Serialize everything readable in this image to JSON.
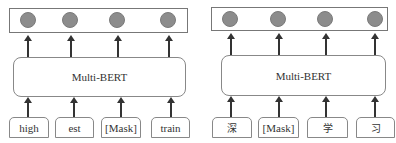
{
  "left_panel": {
    "encoder_label": "Multi-BERT",
    "tokens": [
      "high",
      "est",
      "[Mask]",
      "train"
    ],
    "output_nodes": 4
  },
  "right_panel": {
    "encoder_label": "Multi-BERT",
    "tokens": [
      "深",
      "[Mask]",
      "学",
      "习"
    ],
    "output_nodes": 4
  },
  "colors": {
    "node_fill": "#8c8c8c",
    "border": "#888888",
    "arrow": "#333333"
  }
}
